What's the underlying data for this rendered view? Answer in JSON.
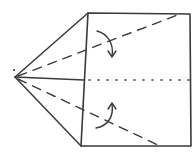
{
  "diagram": {
    "type": "origami-fold-diagram",
    "colors": {
      "background": "#ffffff",
      "ink": "#3a3a3a"
    },
    "points": {
      "apex": [
        15,
        77
      ],
      "square_tl": [
        88,
        13
      ],
      "square_tr": [
        190,
        14
      ],
      "square_br": [
        191,
        146
      ],
      "square_bl": [
        81,
        146
      ],
      "square_ml": [
        84,
        80
      ]
    },
    "lines": {
      "solid": [
        "apex-square_tl",
        "apex-square_bl",
        "apex-square_ml",
        "square outline"
      ],
      "dashed": [
        "apex-top_right",
        "apex-bottom_right"
      ],
      "dotted": [
        "center horizontal 88-190 at y=80"
      ]
    },
    "arrows": [
      {
        "name": "fold-arrow-top",
        "direction": "down"
      },
      {
        "name": "fold-arrow-bottom",
        "direction": "up"
      }
    ]
  }
}
